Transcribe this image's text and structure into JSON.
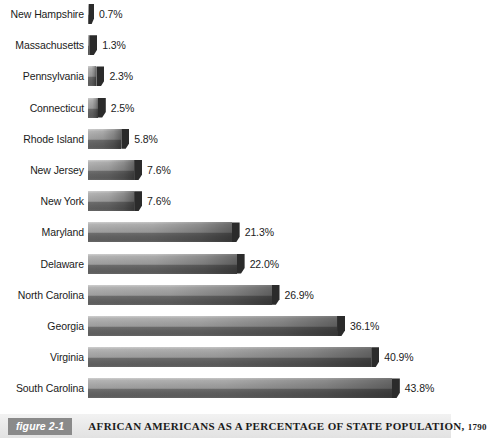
{
  "chart_data": {
    "type": "bar",
    "orientation": "horizontal",
    "title": "AFRICAN AMERICANS AS A PERCENTAGE OF STATE POPULATION, 1790",
    "xlabel": "",
    "ylabel": "",
    "xlim": [
      0,
      43.8
    ],
    "grid": false,
    "legend": null,
    "value_suffix": "%",
    "categories": [
      "New Hampshire",
      "Massachusetts",
      "Pennsylvania",
      "Connecticut",
      "Rhode Island",
      "New Jersey",
      "New York",
      "Maryland",
      "Delaware",
      "North Carolina",
      "Georgia",
      "Virginia",
      "South Carolina"
    ],
    "values": [
      0.7,
      1.3,
      2.3,
      2.5,
      5.8,
      7.6,
      7.6,
      21.3,
      22.0,
      26.9,
      36.1,
      40.9,
      43.8
    ],
    "value_labels": [
      "0.7%",
      "1.3%",
      "2.3%",
      "2.5%",
      "5.8%",
      "7.6%",
      "7.6%",
      "21.3%",
      "22.0%",
      "26.9%",
      "36.1%",
      "40.9%",
      "43.8%"
    ],
    "bar_color_top": "#a8a8a8",
    "bar_color_bottom": "#5d5d5d",
    "bar_tip_color": "#2b2b2b"
  },
  "caption": {
    "figure_badge": "figure 2-1",
    "text": "AFRICAN AMERICANS AS A PERCENTAGE OF STATE POPULATION,",
    "year": "1790",
    "band_color": "#e9e9e9",
    "badge_color": "#8a8a8a"
  }
}
